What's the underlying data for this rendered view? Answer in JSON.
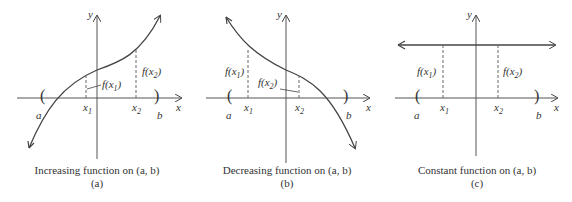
{
  "figure": {
    "panels": [
      {
        "id": "a",
        "caption": "Increasing function on (a, b)",
        "sublabel": "(a)",
        "labels": {
          "y": "y",
          "x": "x",
          "a": "a",
          "b": "b",
          "x1": "x",
          "x1_sub": "1",
          "x2": "x",
          "x2_sub": "2",
          "fx1": "f(x",
          "fx1_sub": "1",
          "fx2": "f(x",
          "fx2_sub": "2",
          "close": ")"
        }
      },
      {
        "id": "b",
        "caption": "Decreasing function on (a, b)",
        "sublabel": "(b)",
        "labels": {
          "y": "y",
          "x": "x",
          "a": "a",
          "b": "b",
          "x1": "x",
          "x1_sub": "1",
          "x2": "x",
          "x2_sub": "2",
          "fx1": "f(x",
          "fx1_sub": "1",
          "fx2": "f(x",
          "fx2_sub": "2",
          "close": ")"
        }
      },
      {
        "id": "c",
        "caption": "Constant function on (a, b)",
        "sublabel": "(c)",
        "labels": {
          "y": "y",
          "x": "x",
          "a": "a",
          "b": "b",
          "x1": "x",
          "x1_sub": "1",
          "x2": "x",
          "x2_sub": "2",
          "fx1": "f(x",
          "fx1_sub": "1",
          "fx2": "f(x",
          "fx2_sub": "2",
          "close": ")"
        }
      }
    ],
    "colors": {
      "curve": "#444444",
      "axis": "#555555",
      "dash": "#666666"
    }
  }
}
